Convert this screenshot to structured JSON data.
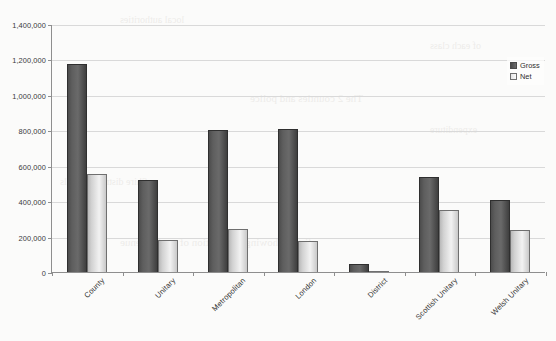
{
  "chart_data": {
    "type": "bar",
    "title": "",
    "xlabel": "",
    "ylabel": "",
    "ylim": [
      0,
      1400000
    ],
    "ytick_interval": 200000,
    "grid": true,
    "legend_position": "top-right",
    "categories": [
      "County",
      "Unitary",
      "Metropolitan",
      "London",
      "District",
      "Scottish Unitary",
      "Welsh Unitary"
    ],
    "ytick_labels": [
      "0",
      "200,000",
      "400,000",
      "600,000",
      "800,000",
      "1,000,000",
      "1,200,000",
      "1,400,000"
    ],
    "ytick_values": [
      0,
      200000,
      400000,
      600000,
      800000,
      1000000,
      1200000,
      1400000
    ],
    "series": [
      {
        "name": "Gross",
        "color": "#5e5e5e",
        "values": [
          1175000,
          520000,
          800000,
          810000,
          47000,
          535000,
          405000
        ]
      },
      {
        "name": "Net",
        "color": "#e8e8e8",
        "values": [
          555000,
          178000,
          245000,
          175000,
          5000,
          350000,
          240000
        ]
      }
    ]
  },
  "legend": {
    "items": [
      {
        "label": "Gross",
        "swatch": "gross"
      },
      {
        "label": "Net",
        "swatch": "net"
      }
    ]
  },
  "background_bleed": [
    {
      "text": "local authorities",
      "x": 120,
      "y": 14,
      "size": 10
    },
    {
      "text": "The 2 counties and police",
      "x": 250,
      "y": 92,
      "size": 11
    },
    {
      "text": "Shire district councils",
      "x": 60,
      "y": 176,
      "size": 10
    },
    {
      "text": "figure showing distribution of total revenue",
      "x": 120,
      "y": 236,
      "size": 11
    },
    {
      "text": "of each class",
      "x": 430,
      "y": 40,
      "size": 10
    },
    {
      "text": "expenditure",
      "x": 430,
      "y": 124,
      "size": 10
    }
  ]
}
